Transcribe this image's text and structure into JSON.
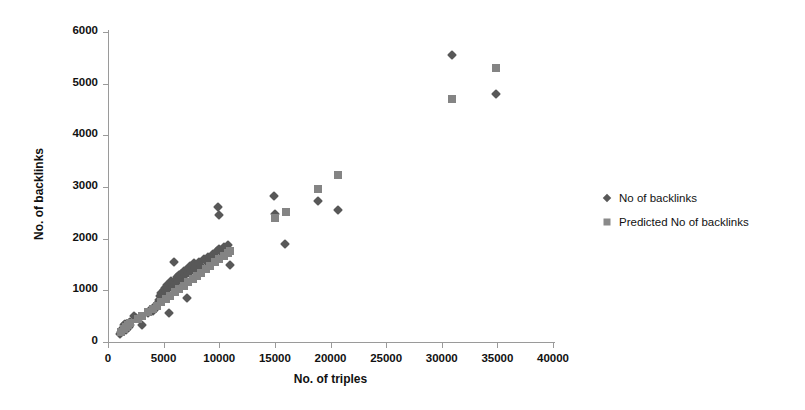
{
  "chart_data": {
    "type": "scatter",
    "title": "",
    "xlabel": "No. of triples",
    "ylabel": "No. of backlinks",
    "xlim": [
      0,
      40000
    ],
    "ylim": [
      0,
      6000
    ],
    "xticks": [
      0,
      5000,
      10000,
      15000,
      20000,
      25000,
      30000,
      35000,
      40000
    ],
    "yticks": [
      0,
      1000,
      2000,
      3000,
      4000,
      5000,
      6000
    ],
    "xtick_labels": [
      "0",
      "5000",
      "10000",
      "15000",
      "20000",
      "25000",
      "30000",
      "35000",
      "40000"
    ],
    "ytick_labels": [
      "0",
      "1000",
      "2000",
      "3000",
      "4000",
      "5000",
      "6000"
    ],
    "grid": false,
    "legend_position": "right",
    "series": [
      {
        "name": "No of backlinks",
        "marker": "diamond",
        "color": "#585858",
        "points": [
          [
            1100,
            150
          ],
          [
            1200,
            190
          ],
          [
            1250,
            240
          ],
          [
            1300,
            210
          ],
          [
            1350,
            280
          ],
          [
            1400,
            260
          ],
          [
            1450,
            320
          ],
          [
            1500,
            300
          ],
          [
            1550,
            350
          ],
          [
            1600,
            250
          ],
          [
            1650,
            230
          ],
          [
            1700,
            330
          ],
          [
            1750,
            270
          ],
          [
            1800,
            310
          ],
          [
            1850,
            360
          ],
          [
            1900,
            300
          ],
          [
            1950,
            380
          ],
          [
            2000,
            330
          ],
          [
            2300,
            500
          ],
          [
            2500,
            470
          ],
          [
            3100,
            330
          ],
          [
            3600,
            560
          ],
          [
            3800,
            620
          ],
          [
            4000,
            600
          ],
          [
            4200,
            700
          ],
          [
            4300,
            660
          ],
          [
            4500,
            760
          ],
          [
            4600,
            820
          ],
          [
            4700,
            900
          ],
          [
            4800,
            950
          ],
          [
            4900,
            870
          ],
          [
            5000,
            1000
          ],
          [
            5100,
            1050
          ],
          [
            5200,
            980
          ],
          [
            5300,
            1100
          ],
          [
            5400,
            1030
          ],
          [
            5500,
            560
          ],
          [
            5600,
            1120
          ],
          [
            5700,
            1180
          ],
          [
            5800,
            1080
          ],
          [
            5900,
            1550
          ],
          [
            6000,
            1130
          ],
          [
            6100,
            1200
          ],
          [
            6200,
            1260
          ],
          [
            6300,
            1180
          ],
          [
            6400,
            1300
          ],
          [
            6500,
            1240
          ],
          [
            6600,
            1320
          ],
          [
            6700,
            1150
          ],
          [
            6800,
            1380
          ],
          [
            6900,
            1290
          ],
          [
            7000,
            1400
          ],
          [
            7100,
            860
          ],
          [
            7200,
            1340
          ],
          [
            7300,
            1420
          ],
          [
            7400,
            1480
          ],
          [
            7500,
            1380
          ],
          [
            7600,
            1460
          ],
          [
            7700,
            1520
          ],
          [
            7800,
            1440
          ],
          [
            7900,
            1500
          ],
          [
            8000,
            1290
          ],
          [
            8200,
            1540
          ],
          [
            8400,
            1480
          ],
          [
            8600,
            1600
          ],
          [
            8800,
            1560
          ],
          [
            9000,
            1650
          ],
          [
            9200,
            1600
          ],
          [
            9400,
            1700
          ],
          [
            9600,
            1640
          ],
          [
            9800,
            1760
          ],
          [
            9900,
            2620
          ],
          [
            9950,
            2450
          ],
          [
            10000,
            1800
          ],
          [
            10200,
            1740
          ],
          [
            10400,
            1830
          ],
          [
            10600,
            1790
          ],
          [
            10800,
            1870
          ],
          [
            11000,
            1500
          ],
          [
            14900,
            2820
          ],
          [
            15000,
            2470
          ],
          [
            15900,
            1900
          ],
          [
            18900,
            2730
          ],
          [
            20700,
            2560
          ],
          [
            30900,
            5550
          ],
          [
            34900,
            4800
          ]
        ]
      },
      {
        "name": "Predicted No of backlinks",
        "marker": "square",
        "color": "#848484",
        "points": [
          [
            1200,
            200
          ],
          [
            1400,
            250
          ],
          [
            1600,
            290
          ],
          [
            1800,
            330
          ],
          [
            2000,
            360
          ],
          [
            2700,
            440
          ],
          [
            3100,
            500
          ],
          [
            3600,
            580
          ],
          [
            4000,
            640
          ],
          [
            4400,
            700
          ],
          [
            4800,
            780
          ],
          [
            5200,
            840
          ],
          [
            5600,
            900
          ],
          [
            6000,
            960
          ],
          [
            6400,
            1030
          ],
          [
            6800,
            1090
          ],
          [
            7200,
            1160
          ],
          [
            7600,
            1220
          ],
          [
            8000,
            1280
          ],
          [
            8400,
            1340
          ],
          [
            8800,
            1410
          ],
          [
            9200,
            1470
          ],
          [
            9600,
            1540
          ],
          [
            10000,
            1600
          ],
          [
            10400,
            1660
          ],
          [
            10800,
            1730
          ],
          [
            11000,
            1760
          ],
          [
            15000,
            2400
          ],
          [
            16000,
            2520
          ],
          [
            18900,
            2960
          ],
          [
            20700,
            3230
          ],
          [
            30900,
            4700
          ],
          [
            34900,
            5300
          ]
        ]
      }
    ]
  },
  "legend": {
    "items": [
      {
        "label": "No of backlinks",
        "marker": "diamond"
      },
      {
        "label": "Predicted No of backlinks",
        "marker": "square"
      }
    ]
  }
}
